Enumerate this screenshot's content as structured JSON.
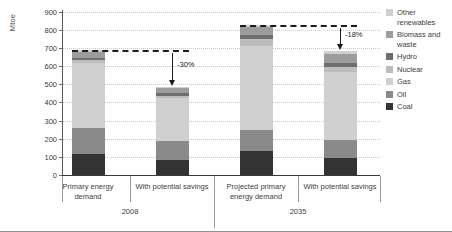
{
  "chart_data": {
    "type": "bar",
    "title": "",
    "subtitle": "",
    "xlabel": "",
    "ylabel": "Mtoe",
    "ylim": [
      0,
      900
    ],
    "yticks": [
      0,
      100,
      200,
      300,
      400,
      500,
      600,
      700,
      800,
      900
    ],
    "grid": true,
    "stacked": true,
    "legend_position": "right",
    "categories": [
      "Primary energy demand",
      "With potential savings",
      "Projected primary energy demand",
      "With potential savings"
    ],
    "groups": [
      {
        "label": "2008",
        "categories": [
          0,
          1
        ]
      },
      {
        "label": "2035",
        "categories": [
          2,
          3
        ]
      }
    ],
    "series": [
      {
        "name": "Coal",
        "color": "#333333",
        "values": [
          118,
          82,
          130,
          92
        ]
      },
      {
        "name": "Oil",
        "color": "#8a8a8a",
        "values": [
          140,
          105,
          120,
          103
        ]
      },
      {
        "name": "Gas",
        "color": "#d0d0d0",
        "values": [
          358,
          238,
          460,
          370
        ]
      },
      {
        "name": "Nuclear",
        "color": "#bdbdbd",
        "values": [
          15,
          12,
          40,
          32
        ]
      },
      {
        "name": "Hydro",
        "color": "#6e6e6e",
        "values": [
          14,
          13,
          22,
          20
        ]
      },
      {
        "name": "Biomass and waste",
        "color": "#9c9c9c",
        "values": [
          32,
          29,
          42,
          50
        ]
      },
      {
        "name": "Other renewables",
        "color": "#cfcfcf",
        "values": [
          9,
          8,
          12,
          15
        ]
      }
    ],
    "totals": [
      686,
      487,
      826,
      682
    ],
    "annotations": [
      {
        "label": "-30%",
        "from_value": 686,
        "to_value": 487,
        "target_bar": 1
      },
      {
        "label": "-18%",
        "from_value": 826,
        "to_value": 682,
        "target_bar": 3
      }
    ],
    "reference_lines": [
      {
        "value": 686,
        "from_bar": 0,
        "to_bar": 1,
        "style": "dashed"
      },
      {
        "value": 826,
        "from_bar": 2,
        "to_bar": 3,
        "style": "dashed"
      }
    ]
  },
  "legend": {
    "items": [
      "Other renewables",
      "Biomass and waste",
      "Hydro",
      "Nuclear",
      "Gas",
      "Oil",
      "Coal"
    ]
  }
}
